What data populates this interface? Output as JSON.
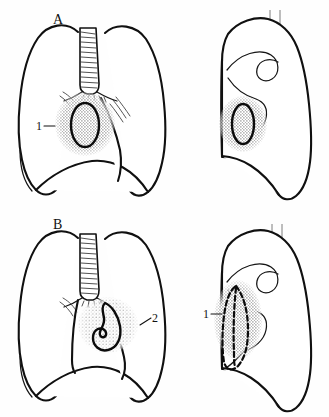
{
  "figure": {
    "background_color": "#fefefe",
    "ink_color": "#101010",
    "stipple_color": "#8c8c8c",
    "spine_line_color": "#707070",
    "width": 329,
    "height": 417
  },
  "panels": [
    {
      "id": "A",
      "panel_label": "A",
      "views": [
        {
          "view": "frontal",
          "view_name": "postero-anterior chest outline",
          "structures": [
            "right lung",
            "left lung",
            "trachea",
            "main bronchi",
            "diaphragm",
            "hilar vessels"
          ],
          "lesion": {
            "shape": "round stippled mass with dark oval ring",
            "location": "right hilar / perihilar region",
            "callout": "1"
          }
        },
        {
          "view": "lateral",
          "view_name": "lateral chest outline",
          "structures": [
            "lung outline",
            "hilar hook shadow",
            "vertebral column lines",
            "diaphragm"
          ],
          "lesion": {
            "shape": "round stippled mass with dark oval ring",
            "location": "anterior-inferior hilar region",
            "callout": ""
          }
        }
      ]
    },
    {
      "id": "B",
      "panel_label": "B",
      "views": [
        {
          "view": "frontal",
          "view_name": "postero-anterior chest outline",
          "structures": [
            "right lung",
            "left lung",
            "trachea",
            "main bronchi",
            "diaphragm",
            "hilar vessels"
          ],
          "lesion": {
            "shape": "comma / hook shaped dark outline within stippled haze",
            "location": "left cardiophrenic / lower mediastinal region",
            "callout": "2"
          }
        },
        {
          "view": "lateral",
          "view_name": "lateral chest outline",
          "structures": [
            "lung outline",
            "hilar hook shadow",
            "vertebral column lines",
            "diaphragm"
          ],
          "lesion": {
            "shape": "elongated vertical stippled band with dashed dark outline",
            "location": "anterior retrosternal region",
            "callout": "1"
          }
        }
      ]
    }
  ],
  "callouts": [
    {
      "id": "a-frontal-1",
      "text": "1",
      "panel": "A",
      "view": "frontal",
      "x": 38,
      "y": 126
    },
    {
      "id": "b-frontal-2",
      "text": "2",
      "panel": "B",
      "view": "frontal",
      "x": 155,
      "y": 319
    },
    {
      "id": "b-lateral-1",
      "text": "1",
      "panel": "B",
      "view": "lateral",
      "x": 205,
      "y": 314
    }
  ],
  "panel_labels": [
    {
      "text": "A",
      "x": 57,
      "y": 22
    },
    {
      "text": "B",
      "x": 57,
      "y": 227
    }
  ]
}
